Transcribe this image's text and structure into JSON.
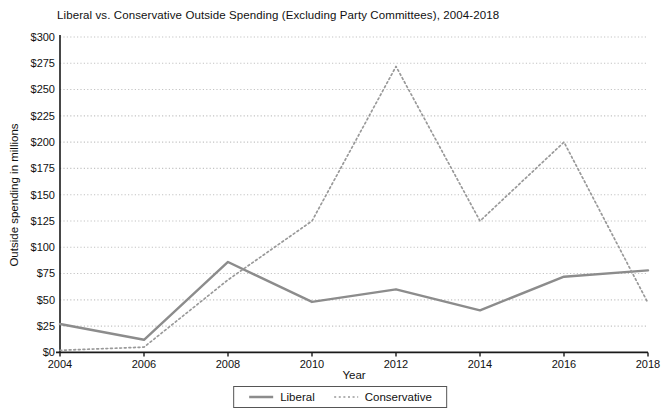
{
  "chart_data": {
    "type": "line",
    "title": "Liberal vs. Conservative Outside Spending (Excluding Party Committees), 2004-2018",
    "xlabel": "Year",
    "ylabel": "Outside spending in millions",
    "x": [
      2004,
      2006,
      2008,
      2010,
      2012,
      2014,
      2016,
      2018
    ],
    "xtick_labels": [
      "2004",
      "2006",
      "2008",
      "2010",
      "2012",
      "2014",
      "2016",
      "2018"
    ],
    "xlim": [
      2004,
      2018
    ],
    "ylim": [
      0,
      300
    ],
    "yticks": [
      0,
      25,
      50,
      75,
      100,
      125,
      150,
      175,
      200,
      225,
      250,
      275,
      300
    ],
    "ytick_labels": [
      "$0",
      "$25",
      "$50",
      "$75",
      "$100",
      "$125",
      "$150",
      "$175",
      "$200",
      "$225",
      "$250",
      "$275",
      "$300"
    ],
    "grid": "horizontal-dotted",
    "legend_position": "bottom-center",
    "series": [
      {
        "name": "Liberal",
        "line_style": "solid",
        "color": "#8c8c8c",
        "values": [
          27,
          12,
          86,
          48,
          60,
          40,
          72,
          78
        ]
      },
      {
        "name": "Conservative",
        "line_style": "dotted",
        "color": "#999999",
        "values": [
          2,
          5,
          69,
          125,
          272,
          125,
          200,
          47
        ]
      }
    ],
    "colors": {
      "gridline": "#c4c4c4",
      "axis": "#1a1a1a",
      "text": "#111111"
    }
  }
}
